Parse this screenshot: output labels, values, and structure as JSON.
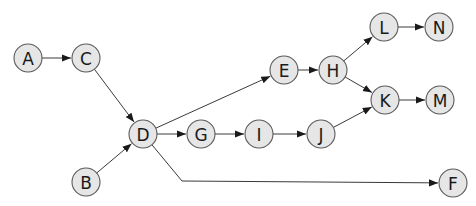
{
  "diagram": {
    "type": "directed-graph",
    "node_radius": 14,
    "colors": {
      "node_fill": "#e6e6e6",
      "node_stroke": "#5a5a5a",
      "edge": "#3a3a3a",
      "label": "#1a1a1a",
      "background": "#ffffff"
    },
    "nodes": [
      {
        "id": "A",
        "label": "A",
        "x": 28,
        "y": 58
      },
      {
        "id": "C",
        "label": "C",
        "x": 86,
        "y": 58
      },
      {
        "id": "B",
        "label": "B",
        "x": 86,
        "y": 182
      },
      {
        "id": "D",
        "label": "D",
        "x": 143,
        "y": 134
      },
      {
        "id": "G",
        "label": "G",
        "x": 201,
        "y": 134
      },
      {
        "id": "I",
        "label": "I",
        "x": 259,
        "y": 134
      },
      {
        "id": "J",
        "label": "J",
        "x": 321,
        "y": 134
      },
      {
        "id": "E",
        "label": "E",
        "x": 284,
        "y": 70
      },
      {
        "id": "H",
        "label": "H",
        "x": 333,
        "y": 70
      },
      {
        "id": "L",
        "label": "L",
        "x": 384,
        "y": 27
      },
      {
        "id": "N",
        "label": "N",
        "x": 439,
        "y": 27
      },
      {
        "id": "K",
        "label": "K",
        "x": 385,
        "y": 100
      },
      {
        "id": "M",
        "label": "M",
        "x": 440,
        "y": 100
      },
      {
        "id": "F",
        "label": "F",
        "x": 453,
        "y": 183
      }
    ],
    "edges": [
      {
        "from": "A",
        "to": "C"
      },
      {
        "from": "C",
        "to": "D"
      },
      {
        "from": "B",
        "to": "D"
      },
      {
        "from": "D",
        "to": "G"
      },
      {
        "from": "G",
        "to": "I"
      },
      {
        "from": "I",
        "to": "J"
      },
      {
        "from": "D",
        "to": "E"
      },
      {
        "from": "E",
        "to": "H"
      },
      {
        "from": "H",
        "to": "L"
      },
      {
        "from": "H",
        "to": "K"
      },
      {
        "from": "J",
        "to": "K"
      },
      {
        "from": "L",
        "to": "N"
      },
      {
        "from": "K",
        "to": "M"
      },
      {
        "from": "D",
        "to": "F",
        "via": [
          [
            182,
            181
          ]
        ]
      }
    ]
  }
}
